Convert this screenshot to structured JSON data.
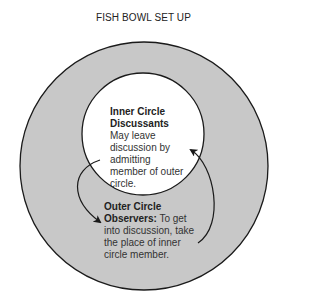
{
  "title": "FISH BOWL SET UP",
  "inner_circle": {
    "heading_line1": "Inner Circle",
    "heading_line2": "Discussants",
    "description_lines": [
      "May leave",
      "discussion by",
      "admitting",
      "member of outer",
      "circle."
    ]
  },
  "outer_circle": {
    "heading_line1": "Outer Circle",
    "heading_bold": "Observers:",
    "description_first": " To get",
    "description_lines": [
      "into discussion, take",
      "the place of inner",
      "circle member."
    ]
  },
  "colors": {
    "outer_fill": "#c8c8c8",
    "inner_fill": "#ffffff",
    "stroke": "#1a1a1a"
  }
}
